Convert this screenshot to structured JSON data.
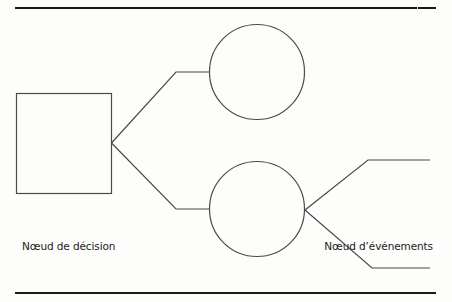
{
  "diagram": {
    "type": "decision-tree",
    "labels": {
      "decision_node": "Nœud de décision",
      "event_node": "Nœud d’événements"
    },
    "nodes": [
      {
        "id": "decision",
        "shape": "square",
        "x": 16,
        "y": 93,
        "width": 95,
        "height": 100
      },
      {
        "id": "event-upper",
        "shape": "circle",
        "cx": 257,
        "cy": 72,
        "r": 47
      },
      {
        "id": "event-lower",
        "shape": "circle",
        "cx": 257,
        "cy": 209,
        "r": 47
      }
    ],
    "branches": [
      {
        "from": "decision",
        "to": "event-upper"
      },
      {
        "from": "decision",
        "to": "event-lower"
      },
      {
        "from": "event-lower",
        "to": "outcome-upper"
      },
      {
        "from": "event-lower",
        "to": "outcome-lower"
      }
    ],
    "colors": {
      "stroke": "#4a4a4a",
      "rule": "#1a1a1a",
      "text": "#222222",
      "background": "#fdfdfc"
    }
  }
}
